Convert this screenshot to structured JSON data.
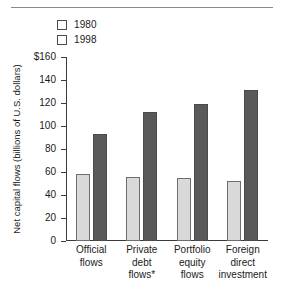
{
  "chart_data": {
    "type": "bar",
    "title": "",
    "xlabel": "",
    "ylabel": "Net capital flows (billions of U.S. dollars)",
    "categories": [
      "Official\nflows",
      "Private\ndebt\nflows*",
      "Portfolio\nequity\nflows",
      "Foreign\ndirect\ninvestment"
    ],
    "series": [
      {
        "name": "1980",
        "color": "#d9d9d9",
        "values": [
          58,
          56,
          55,
          52
        ]
      },
      {
        "name": "1998",
        "color": "#595959",
        "values": [
          93,
          112,
          119,
          131
        ]
      }
    ],
    "ylim": [
      0,
      160
    ],
    "yticks": [
      0,
      20,
      40,
      60,
      80,
      100,
      120,
      140,
      160
    ],
    "ytick_labels": [
      "0",
      "20",
      "40",
      "60",
      "80",
      "100",
      "120",
      "140",
      "$160"
    ],
    "grid": false,
    "legend_position": "top-left"
  },
  "legend": {
    "entries": [
      {
        "label": "1980",
        "color": "#d9d9d9"
      },
      {
        "label": "1998",
        "color": "#595959"
      }
    ]
  },
  "colors": {
    "series_1980": "#d9d9d9",
    "series_1998": "#595959",
    "axis": "#3a3a3a",
    "rule": "#8a8a8a",
    "text": "#1a1a1a",
    "background": "#ffffff"
  }
}
